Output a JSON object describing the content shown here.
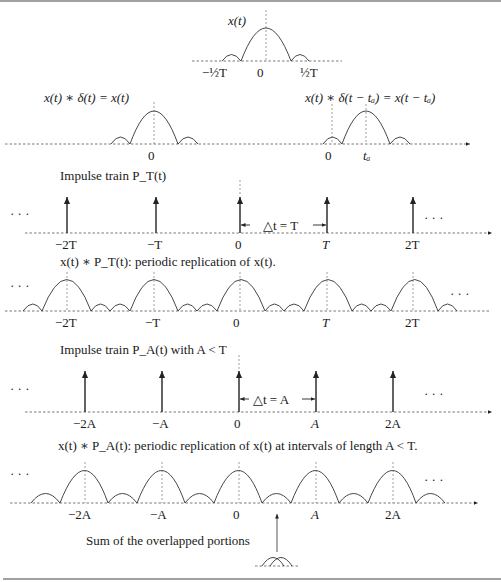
{
  "panels": {
    "pulse": {
      "label": "x(t)",
      "ticks": [
        "−½T",
        "0",
        "½T"
      ]
    },
    "shift": {
      "left_label": "x(t) ∗ δ(t) = x(t)",
      "right_label": "x(t) ∗ δ(t − tₐ) = x(t − tₐ)",
      "left_tick": "0",
      "right_ticks": [
        "0",
        "tₐ"
      ]
    },
    "impulse_T": {
      "title": "Impulse train P_T(t)",
      "ticks": [
        "−2T",
        "−T",
        "0",
        "T",
        "2T"
      ],
      "spacing_label": "△t = T",
      "ellipsis": "· · ·"
    },
    "replication_T": {
      "title": "x(t) ∗ P_T(t): periodic replication of x(t).",
      "ticks": [
        "−2T",
        "−T",
        "0",
        "T",
        "2T"
      ],
      "ellipsis": "· · ·"
    },
    "impulse_A": {
      "title": "Impulse train P_A(t) with A < T",
      "ticks": [
        "−2A",
        "−A",
        "0",
        "A",
        "2A"
      ],
      "spacing_label": "△t = A",
      "ellipsis": "· · ·"
    },
    "replication_A": {
      "title": "x(t) ∗ P_A(t): periodic replication of x(t) at intervals of length A < T.",
      "ticks": [
        "−2A",
        "−A",
        "0",
        "A",
        "2A"
      ],
      "ellipsis": "· · ·",
      "annotation": "Sum of the overlapped portions"
    }
  }
}
